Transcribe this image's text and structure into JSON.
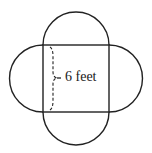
{
  "diagram": {
    "shapes": {
      "square": {
        "side_label": "6 feet"
      },
      "semicircles": [
        "top",
        "right",
        "bottom",
        "left"
      ]
    },
    "dimension_label": "6 feet",
    "colors": {
      "stroke": "#222222",
      "background": "#ffffff"
    }
  }
}
